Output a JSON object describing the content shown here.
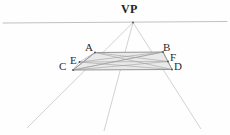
{
  "figure": {
    "background_color": "#fefefe",
    "width": 230,
    "height": 135
  },
  "labels": {
    "vp": "VP",
    "a": "A",
    "b": "B",
    "c": "C",
    "d": "D",
    "e": "E",
    "f": "F"
  },
  "colors": {
    "horizon_line": "#b9b9b9",
    "ray_line": "#c6c6c6",
    "shape_outline": "#8a8a8a",
    "shape_fill": "#e9e9e9",
    "interior_line": "#9a9a9a",
    "label_text": "#2b2b2b",
    "vp_text": "#222222",
    "vertex_dot": "#555555"
  },
  "geometry": {
    "vanishing_point": {
      "x": 133,
      "y": 22.5
    },
    "horizon_line": {
      "x1": 3,
      "y1": 23,
      "x2": 227,
      "y2": 21.5
    },
    "quad_vertices": {
      "A": {
        "x": 95,
        "y": 52.5
      },
      "B": {
        "x": 163,
        "y": 52.0
      },
      "D": {
        "x": 172,
        "y": 69.5
      },
      "C": {
        "x": 73,
        "y": 70.0
      }
    },
    "side_points": {
      "E": {
        "x": 79.5,
        "y": 62.0
      },
      "F": {
        "x": 168.0,
        "y": 61.5
      }
    },
    "diagonal_crossing": {
      "x": 123,
      "y": 61
    },
    "vp_rays": [
      {
        "name": "ray-left",
        "x1": 133,
        "y1": 22.5,
        "x2": 27,
        "y2": 128
      },
      {
        "name": "ray-center",
        "x1": 133,
        "y1": 22.5,
        "x2": 104,
        "y2": 131
      },
      {
        "name": "ray-right",
        "x1": 133,
        "y1": 22.5,
        "x2": 201,
        "y2": 129
      }
    ],
    "interior_segments": [
      {
        "name": "diagonal-A-D",
        "x1": 95,
        "y1": 52.5,
        "x2": 172,
        "y2": 69.5
      },
      {
        "name": "diagonal-B-C",
        "x1": 163,
        "y1": 52.0,
        "x2": 73,
        "y2": 70.0
      },
      {
        "name": "segment-E-B",
        "x1": 79.5,
        "y1": 62.0,
        "x2": 163,
        "y2": 52.0
      },
      {
        "name": "segment-E-F",
        "x1": 79.5,
        "y1": 62.0,
        "x2": 168,
        "y2": 61.5
      },
      {
        "name": "segment-E-D",
        "x1": 79.5,
        "y1": 62.0,
        "x2": 172,
        "y2": 69.5
      },
      {
        "name": "segment-C-F",
        "x1": 73,
        "y1": 70.0,
        "x2": 168,
        "y2": 61.5
      },
      {
        "name": "segment-C-B",
        "x1": 73,
        "y1": 70.0,
        "x2": 163,
        "y2": 52.0
      },
      {
        "name": "segment-A-F",
        "x1": 95,
        "y1": 52.5,
        "x2": 168,
        "y2": 61.5
      },
      {
        "name": "segment-A-E",
        "x1": 95,
        "y1": 52.5,
        "x2": 79.5,
        "y2": 62.0
      },
      {
        "name": "segment-A-C",
        "x1": 95,
        "y1": 52.5,
        "x2": 73,
        "y2": 70.0
      },
      {
        "name": "segment-B-F",
        "x1": 163,
        "y1": 52.0,
        "x2": 168,
        "y2": 61.5
      },
      {
        "name": "segment-F-D",
        "x1": 168,
        "y1": 61.5,
        "x2": 172,
        "y2": 69.5
      },
      {
        "name": "segment-E-C",
        "x1": 79.5,
        "y1": 62.0,
        "x2": 73,
        "y2": 70.0
      }
    ]
  },
  "label_positions": {
    "vp": {
      "x": 121,
      "y": 3
    },
    "a": {
      "x": 85,
      "y": 42
    },
    "b": {
      "x": 163,
      "y": 42
    },
    "c": {
      "x": 59,
      "y": 61
    },
    "d": {
      "x": 174,
      "y": 61
    },
    "e": {
      "x": 70,
      "y": 55
    },
    "f": {
      "x": 170,
      "y": 52
    }
  }
}
